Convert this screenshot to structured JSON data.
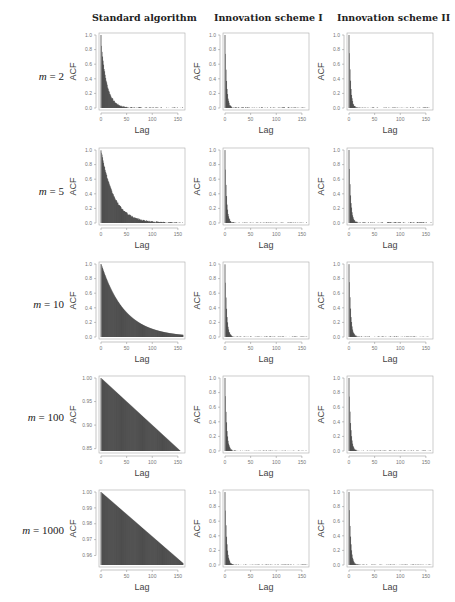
{
  "figure": {
    "column_titles": [
      "Standard algorithm",
      "Innovation scheme I",
      "Innovation scheme II"
    ],
    "row_labels": [
      {
        "var": "m",
        "eq": " = 2"
      },
      {
        "var": "m",
        "eq": " = 5"
      },
      {
        "var": "m",
        "eq": " = 10"
      },
      {
        "var": "m",
        "eq": " = 100"
      },
      {
        "var": "m",
        "eq": " = 1000"
      }
    ],
    "colors": {
      "bars": "#3a3a3a",
      "axis": "#888888",
      "frame": "#aaaaaa",
      "text": "#555555"
    }
  },
  "chart_data": [
    {
      "row": 0,
      "col": 0,
      "type": "bar",
      "title": "Standard algorithm",
      "row_label": "m = 2",
      "xlabel": "Lag",
      "ylabel": "ACF",
      "xlim": [
        0,
        160
      ],
      "ylim": [
        0,
        1.0
      ],
      "xticks": [
        0,
        50,
        100,
        150
      ],
      "yticks": [
        0.0,
        0.2,
        0.4,
        0.6,
        0.8,
        1.0
      ],
      "ytick_labels": [
        "0.0",
        "0.2",
        "0.4",
        "0.6",
        "0.8",
        "1.0"
      ],
      "decay": "exponential",
      "acf_lag1": 0.85,
      "rate": 0.09,
      "tail_noise": 0.01
    },
    {
      "row": 0,
      "col": 1,
      "type": "bar",
      "title": "Innovation scheme I",
      "row_label": "m = 2",
      "xlabel": "Lag",
      "ylabel": "ACF",
      "xlim": [
        0,
        160
      ],
      "ylim": [
        0,
        1.0
      ],
      "xticks": [
        0,
        50,
        100,
        150
      ],
      "yticks": [
        0.0,
        0.2,
        0.4,
        0.6,
        0.8,
        1.0
      ],
      "ytick_labels": [
        "0.0",
        "0.2",
        "0.4",
        "0.6",
        "0.8",
        "1.0"
      ],
      "decay": "exponential",
      "acf_lag1": 0.75,
      "rate": 0.35,
      "tail_noise": 0.01
    },
    {
      "row": 0,
      "col": 2,
      "type": "bar",
      "title": "Innovation scheme II",
      "row_label": "m = 2",
      "xlabel": "Lag",
      "ylabel": "ACF",
      "xlim": [
        0,
        160
      ],
      "ylim": [
        0,
        1.0
      ],
      "xticks": [
        0,
        50,
        100,
        150
      ],
      "yticks": [
        0.0,
        0.2,
        0.4,
        0.6,
        0.8,
        1.0
      ],
      "ytick_labels": [
        "0.0",
        "0.2",
        "0.4",
        "0.6",
        "0.8",
        "1.0"
      ],
      "decay": "exponential",
      "acf_lag1": 0.75,
      "rate": 0.35,
      "tail_noise": 0.008
    },
    {
      "row": 1,
      "col": 0,
      "type": "bar",
      "title": "Standard algorithm",
      "row_label": "m = 5",
      "xlabel": "Lag",
      "ylabel": "ACF",
      "xlim": [
        0,
        160
      ],
      "ylim": [
        0,
        1.0
      ],
      "xticks": [
        0,
        50,
        100,
        150
      ],
      "yticks": [
        0.0,
        0.2,
        0.4,
        0.6,
        0.8,
        1.0
      ],
      "ytick_labels": [
        "0.0",
        "0.2",
        "0.4",
        "0.6",
        "0.8",
        "1.0"
      ],
      "decay": "exponential",
      "acf_lag1": 0.97,
      "rate": 0.04,
      "tail_noise": 0.01
    },
    {
      "row": 1,
      "col": 1,
      "type": "bar",
      "title": "Innovation scheme I",
      "row_label": "m = 5",
      "xlabel": "Lag",
      "ylabel": "ACF",
      "xlim": [
        0,
        160
      ],
      "ylim": [
        0,
        1.0
      ],
      "xticks": [
        0,
        50,
        100,
        150
      ],
      "yticks": [
        0.0,
        0.2,
        0.4,
        0.6,
        0.8,
        1.0
      ],
      "ytick_labels": [
        "0.0",
        "0.2",
        "0.4",
        "0.6",
        "0.8",
        "1.0"
      ],
      "decay": "exponential",
      "acf_lag1": 0.73,
      "rate": 0.35,
      "tail_noise": 0.008
    },
    {
      "row": 1,
      "col": 2,
      "type": "bar",
      "title": "Innovation scheme II",
      "row_label": "m = 5",
      "xlabel": "Lag",
      "ylabel": "ACF",
      "xlim": [
        0,
        160
      ],
      "ylim": [
        0,
        1.0
      ],
      "xticks": [
        0,
        50,
        100,
        150
      ],
      "yticks": [
        0.0,
        0.2,
        0.4,
        0.6,
        0.8,
        1.0
      ],
      "ytick_labels": [
        "0.0",
        "0.2",
        "0.4",
        "0.6",
        "0.8",
        "1.0"
      ],
      "decay": "exponential",
      "acf_lag1": 0.75,
      "rate": 0.33,
      "tail_noise": 0.012
    },
    {
      "row": 2,
      "col": 0,
      "type": "bar",
      "title": "Standard algorithm",
      "row_label": "m = 10",
      "xlabel": "Lag",
      "ylabel": "ACF",
      "xlim": [
        0,
        160
      ],
      "ylim": [
        0,
        1.0
      ],
      "xticks": [
        0,
        50,
        100,
        150
      ],
      "yticks": [
        0.0,
        0.2,
        0.4,
        0.6,
        0.8,
        1.0
      ],
      "ytick_labels": [
        "0.0",
        "0.2",
        "0.4",
        "0.6",
        "0.8",
        "1.0"
      ],
      "decay": "exponential",
      "acf_lag1": 0.99,
      "rate": 0.022,
      "tail_noise": 0.0
    },
    {
      "row": 2,
      "col": 1,
      "type": "bar",
      "title": "Innovation scheme I",
      "row_label": "m = 10",
      "xlabel": "Lag",
      "ylabel": "ACF",
      "xlim": [
        0,
        160
      ],
      "ylim": [
        0,
        1.0
      ],
      "xticks": [
        0,
        50,
        100,
        150
      ],
      "yticks": [
        0.0,
        0.2,
        0.4,
        0.6,
        0.8,
        1.0
      ],
      "ytick_labels": [
        "0.0",
        "0.2",
        "0.4",
        "0.6",
        "0.8",
        "1.0"
      ],
      "decay": "exponential",
      "acf_lag1": 0.75,
      "rate": 0.33,
      "tail_noise": 0.008
    },
    {
      "row": 2,
      "col": 2,
      "type": "bar",
      "title": "Innovation scheme II",
      "row_label": "m = 10",
      "xlabel": "Lag",
      "ylabel": "ACF",
      "xlim": [
        0,
        160
      ],
      "ylim": [
        0,
        1.0
      ],
      "xticks": [
        0,
        50,
        100,
        150
      ],
      "yticks": [
        0.0,
        0.2,
        0.4,
        0.6,
        0.8,
        1.0
      ],
      "ytick_labels": [
        "0.0",
        "0.2",
        "0.4",
        "0.6",
        "0.8",
        "1.0"
      ],
      "decay": "exponential",
      "acf_lag1": 0.75,
      "rate": 0.33,
      "tail_noise": 0.008
    },
    {
      "row": 3,
      "col": 0,
      "type": "bar",
      "title": "Standard algorithm",
      "row_label": "m = 100",
      "xlabel": "Lag",
      "ylabel": "ACF",
      "xlim": [
        0,
        160
      ],
      "ylim": [
        0.845,
        1.0
      ],
      "xticks": [
        0,
        50,
        100,
        150
      ],
      "yticks": [
        0.85,
        0.9,
        0.95,
        1.0
      ],
      "ytick_labels": [
        "0.85",
        "0.90",
        "0.95",
        "1.00"
      ],
      "decay": "linear",
      "acf_lag1": 0.999,
      "slope": -0.001,
      "tail_noise": 0.0
    },
    {
      "row": 3,
      "col": 1,
      "type": "bar",
      "title": "Innovation scheme I",
      "row_label": "m = 100",
      "xlabel": "Lag",
      "ylabel": "ACF",
      "xlim": [
        0,
        160
      ],
      "ylim": [
        0,
        1.0
      ],
      "xticks": [
        0,
        50,
        100,
        150
      ],
      "yticks": [
        0.0,
        0.2,
        0.4,
        0.6,
        0.8,
        1.0
      ],
      "ytick_labels": [
        "0.0",
        "0.2",
        "0.4",
        "0.6",
        "0.8",
        "1.0"
      ],
      "decay": "exponential",
      "acf_lag1": 0.75,
      "rate": 0.33,
      "tail_noise": 0.006
    },
    {
      "row": 3,
      "col": 2,
      "type": "bar",
      "title": "Innovation scheme II",
      "row_label": "m = 100",
      "xlabel": "Lag",
      "ylabel": "ACF",
      "xlim": [
        0,
        160
      ],
      "ylim": [
        0,
        1.0
      ],
      "xticks": [
        0,
        50,
        100,
        150
      ],
      "yticks": [
        0.0,
        0.2,
        0.4,
        0.6,
        0.8,
        1.0
      ],
      "ytick_labels": [
        "0.0",
        "0.2",
        "0.4",
        "0.6",
        "0.8",
        "1.0"
      ],
      "decay": "exponential",
      "acf_lag1": 0.75,
      "rate": 0.33,
      "tail_noise": 0.006
    },
    {
      "row": 4,
      "col": 0,
      "type": "bar",
      "title": "Standard algorithm",
      "row_label": "m = 1000",
      "xlabel": "Lag",
      "ylabel": "ACF",
      "xlim": [
        0,
        160
      ],
      "ylim": [
        0.954,
        1.0
      ],
      "xticks": [
        0,
        50,
        100,
        150
      ],
      "yticks": [
        0.96,
        0.97,
        0.98,
        0.99,
        1.0
      ],
      "ytick_labels": [
        "0.96",
        "0.97",
        "0.98",
        "0.99",
        "1.00"
      ],
      "decay": "linear",
      "acf_lag1": 0.9997,
      "slope": -0.00028,
      "tail_noise": 0.0
    },
    {
      "row": 4,
      "col": 1,
      "type": "bar",
      "title": "Innovation scheme I",
      "row_label": "m = 1000",
      "xlabel": "Lag",
      "ylabel": "ACF",
      "xlim": [
        0,
        160
      ],
      "ylim": [
        0,
        1.0
      ],
      "xticks": [
        0,
        50,
        100,
        150
      ],
      "yticks": [
        0.0,
        0.2,
        0.4,
        0.6,
        0.8,
        1.0
      ],
      "ytick_labels": [
        "0.0",
        "0.2",
        "0.4",
        "0.6",
        "0.8",
        "1.0"
      ],
      "decay": "exponential",
      "acf_lag1": 0.75,
      "rate": 0.33,
      "tail_noise": 0.006
    },
    {
      "row": 4,
      "col": 2,
      "type": "bar",
      "title": "Innovation scheme II",
      "row_label": "m = 1000",
      "xlabel": "Lag",
      "ylabel": "ACF",
      "xlim": [
        0,
        160
      ],
      "ylim": [
        0,
        1.0
      ],
      "xticks": [
        0,
        50,
        100,
        150
      ],
      "yticks": [
        0.0,
        0.2,
        0.4,
        0.6,
        0.8,
        1.0
      ],
      "ytick_labels": [
        "0.0",
        "0.2",
        "0.4",
        "0.6",
        "0.8",
        "1.0"
      ],
      "decay": "exponential",
      "acf_lag1": 0.75,
      "rate": 0.33,
      "tail_noise": 0.006
    }
  ]
}
